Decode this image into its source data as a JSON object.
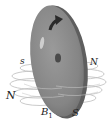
{
  "diagram": {
    "colors": {
      "disk_face": "#8a8a8a",
      "disk_edge": "#5e5e5e",
      "highlight": "#d8d8d8",
      "arrow": "#2a2a2a",
      "axle_dot": "#4a4a4a",
      "field_lines": "#b8b8b8",
      "background": "#ffffff"
    },
    "labels": {
      "s_small": "s",
      "N_right": "N",
      "N_left": "N",
      "B": "B",
      "B_sub": "1",
      "S": "S"
    }
  }
}
